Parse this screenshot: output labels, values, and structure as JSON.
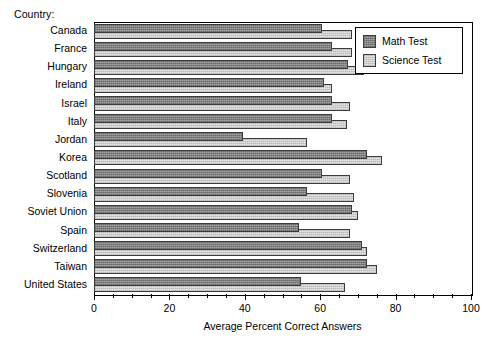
{
  "caption": "Country:",
  "legend": {
    "position": "top-right",
    "entries": [
      {
        "label": "Math Test",
        "color": "#8e8e8e",
        "icon": "legend-swatch-math"
      },
      {
        "label": "Science Test",
        "color": "#d4d4d4",
        "icon": "legend-swatch-science"
      }
    ]
  },
  "axis": {
    "x_title": "Average Percent Correct Answers",
    "x_ticks": [
      0,
      20,
      40,
      60,
      80,
      100
    ],
    "x_minor_step": 5,
    "x_min": 0,
    "x_max": 100
  },
  "chart_data": {
    "type": "bar",
    "orientation": "horizontal",
    "title": "",
    "subtitle": "",
    "xlabel": "Average Percent Correct Answers",
    "ylabel": "Country:",
    "xlim": [
      0,
      100
    ],
    "grid": false,
    "legend_position": "top-right",
    "categories": [
      "Canada",
      "France",
      "Hungary",
      "Ireland",
      "Israel",
      "Italy",
      "Jordan",
      "Korea",
      "Scotland",
      "Slovenia",
      "Soviet Union",
      "Spain",
      "Switzerland",
      "Taiwan",
      "United States"
    ],
    "series": [
      {
        "name": "Math Test",
        "color": "#8e8e8e",
        "values": [
          60.5,
          63,
          67.5,
          61,
          63,
          63,
          39.5,
          72.5,
          60.5,
          56.5,
          68.5,
          54.5,
          71,
          72.5,
          55
        ]
      },
      {
        "name": "Science Test",
        "color": "#d4d4d4",
        "values": [
          68.5,
          68.5,
          71.5,
          63,
          68,
          67,
          56.5,
          76.5,
          68,
          69,
          70,
          68,
          72.5,
          75,
          66.5
        ]
      }
    ]
  }
}
